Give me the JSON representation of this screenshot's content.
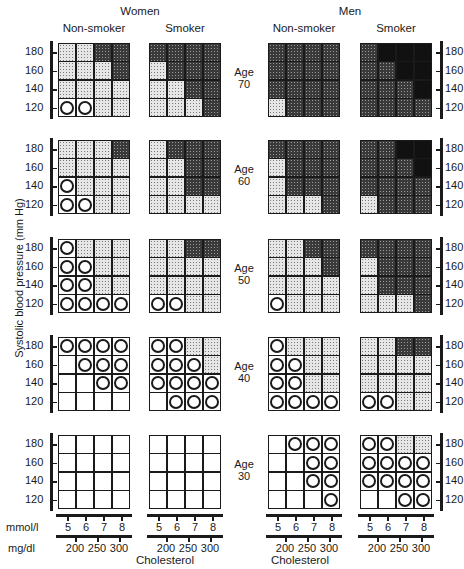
{
  "chart_data": {
    "type": "heatmap",
    "title": "",
    "group_headers": [
      "Women",
      "Men"
    ],
    "panel_headers": [
      "Non-smoker",
      "Smoker",
      "Non-smoker",
      "Smoker"
    ],
    "ylabel": "Systolic blood pressure (mm Hg)",
    "xlabel": "Cholesterol",
    "y_ticks": [
      "180",
      "160",
      "140",
      "120"
    ],
    "x_ticks_mmol": [
      "5",
      "6",
      "7",
      "8"
    ],
    "x_ticks_mgdl": [
      "200",
      "250",
      "300"
    ],
    "x_unit_mmol": "mmol/l",
    "x_unit_mgdl": "mg/dl",
    "legend_encoding": {
      "0": "white (no fill)",
      "C": "circle (lowest risk)",
      "L": "light stipple",
      "D": "dark stipple",
      "B": "solid black (highest risk)"
    },
    "rows": [
      {
        "age_label": "Age",
        "age_value": "70",
        "panels": [
          {
            "sex": "Women",
            "smoking": "Non-smoker",
            "cells": [
              [
                "L",
                "L",
                "D",
                "D"
              ],
              [
                "L",
                "L",
                "L",
                "D"
              ],
              [
                "L",
                "L",
                "L",
                "L"
              ],
              [
                "C",
                "C",
                "L",
                "L"
              ]
            ]
          },
          {
            "sex": "Women",
            "smoking": "Smoker",
            "cells": [
              [
                "D",
                "D",
                "D",
                "D"
              ],
              [
                "L",
                "D",
                "D",
                "D"
              ],
              [
                "L",
                "L",
                "D",
                "D"
              ],
              [
                "L",
                "L",
                "L",
                "D"
              ]
            ]
          },
          {
            "sex": "Men",
            "smoking": "Non-smoker",
            "cells": [
              [
                "D",
                "D",
                "D",
                "D"
              ],
              [
                "D",
                "D",
                "D",
                "D"
              ],
              [
                "D",
                "D",
                "D",
                "D"
              ],
              [
                "L",
                "D",
                "D",
                "D"
              ]
            ]
          },
          {
            "sex": "Men",
            "smoking": "Smoker",
            "cells": [
              [
                "D",
                "B",
                "B",
                "B"
              ],
              [
                "D",
                "D",
                "B",
                "B"
              ],
              [
                "D",
                "D",
                "D",
                "B"
              ],
              [
                "D",
                "D",
                "D",
                "D"
              ]
            ]
          }
        ]
      },
      {
        "age_label": "Age",
        "age_value": "60",
        "panels": [
          {
            "sex": "Women",
            "smoking": "Non-smoker",
            "cells": [
              [
                "L",
                "L",
                "L",
                "D"
              ],
              [
                "L",
                "L",
                "L",
                "L"
              ],
              [
                "C",
                "L",
                "L",
                "L"
              ],
              [
                "C",
                "C",
                "L",
                "L"
              ]
            ]
          },
          {
            "sex": "Women",
            "smoking": "Smoker",
            "cells": [
              [
                "L",
                "D",
                "D",
                "D"
              ],
              [
                "L",
                "L",
                "D",
                "D"
              ],
              [
                "L",
                "L",
                "D",
                "D"
              ],
              [
                "L",
                "L",
                "L",
                "L"
              ]
            ]
          },
          {
            "sex": "Men",
            "smoking": "Non-smoker",
            "cells": [
              [
                "D",
                "D",
                "D",
                "D"
              ],
              [
                "L",
                "D",
                "D",
                "D"
              ],
              [
                "L",
                "D",
                "D",
                "D"
              ],
              [
                "L",
                "L",
                "L",
                "D"
              ]
            ]
          },
          {
            "sex": "Men",
            "smoking": "Smoker",
            "cells": [
              [
                "D",
                "D",
                "B",
                "B"
              ],
              [
                "D",
                "D",
                "D",
                "B"
              ],
              [
                "D",
                "D",
                "D",
                "D"
              ],
              [
                "L",
                "D",
                "D",
                "D"
              ]
            ]
          }
        ]
      },
      {
        "age_label": "Age",
        "age_value": "50",
        "panels": [
          {
            "sex": "Women",
            "smoking": "Non-smoker",
            "cells": [
              [
                "C",
                "L",
                "L",
                "L"
              ],
              [
                "C",
                "C",
                "L",
                "L"
              ],
              [
                "C",
                "C",
                "L",
                "L"
              ],
              [
                "C",
                "C",
                "C",
                "C"
              ]
            ]
          },
          {
            "sex": "Women",
            "smoking": "Smoker",
            "cells": [
              [
                "L",
                "L",
                "D",
                "D"
              ],
              [
                "L",
                "L",
                "L",
                "L"
              ],
              [
                "L",
                "L",
                "L",
                "L"
              ],
              [
                "C",
                "C",
                "L",
                "L"
              ]
            ]
          },
          {
            "sex": "Men",
            "smoking": "Non-smoker",
            "cells": [
              [
                "L",
                "L",
                "D",
                "D"
              ],
              [
                "L",
                "L",
                "L",
                "D"
              ],
              [
                "L",
                "L",
                "L",
                "L"
              ],
              [
                "C",
                "L",
                "L",
                "L"
              ]
            ]
          },
          {
            "sex": "Men",
            "smoking": "Smoker",
            "cells": [
              [
                "D",
                "D",
                "D",
                "D"
              ],
              [
                "L",
                "D",
                "D",
                "D"
              ],
              [
                "L",
                "D",
                "D",
                "D"
              ],
              [
                "L",
                "L",
                "L",
                "D"
              ]
            ]
          }
        ]
      },
      {
        "age_label": "Age",
        "age_value": "40",
        "panels": [
          {
            "sex": "Women",
            "smoking": "Non-smoker",
            "cells": [
              [
                "C",
                "C",
                "C",
                "C"
              ],
              [
                "0",
                "C",
                "C",
                "C"
              ],
              [
                "0",
                "0",
                "C",
                "C"
              ],
              [
                "0",
                "0",
                "0",
                "0"
              ]
            ]
          },
          {
            "sex": "Women",
            "smoking": "Smoker",
            "cells": [
              [
                "C",
                "C",
                "L",
                "L"
              ],
              [
                "C",
                "C",
                "C",
                "L"
              ],
              [
                "C",
                "C",
                "C",
                "C"
              ],
              [
                "0",
                "C",
                "C",
                "C"
              ]
            ]
          },
          {
            "sex": "Men",
            "smoking": "Non-smoker",
            "cells": [
              [
                "C",
                "L",
                "L",
                "L"
              ],
              [
                "C",
                "C",
                "L",
                "L"
              ],
              [
                "C",
                "C",
                "L",
                "L"
              ],
              [
                "C",
                "C",
                "C",
                "C"
              ]
            ]
          },
          {
            "sex": "Men",
            "smoking": "Smoker",
            "cells": [
              [
                "L",
                "L",
                "D",
                "D"
              ],
              [
                "L",
                "L",
                "L",
                "L"
              ],
              [
                "L",
                "L",
                "L",
                "L"
              ],
              [
                "C",
                "C",
                "L",
                "L"
              ]
            ]
          }
        ]
      },
      {
        "age_label": "Age",
        "age_value": "30",
        "panels": [
          {
            "sex": "Women",
            "smoking": "Non-smoker",
            "cells": [
              [
                "0",
                "0",
                "0",
                "0"
              ],
              [
                "0",
                "0",
                "0",
                "0"
              ],
              [
                "0",
                "0",
                "0",
                "0"
              ],
              [
                "0",
                "0",
                "0",
                "0"
              ]
            ]
          },
          {
            "sex": "Women",
            "smoking": "Smoker",
            "cells": [
              [
                "0",
                "0",
                "0",
                "0"
              ],
              [
                "0",
                "0",
                "0",
                "0"
              ],
              [
                "0",
                "0",
                "0",
                "0"
              ],
              [
                "0",
                "0",
                "0",
                "0"
              ]
            ]
          },
          {
            "sex": "Men",
            "smoking": "Non-smoker",
            "cells": [
              [
                "0",
                "C",
                "C",
                "C"
              ],
              [
                "0",
                "0",
                "C",
                "C"
              ],
              [
                "0",
                "0",
                "C",
                "C"
              ],
              [
                "0",
                "0",
                "0",
                "C"
              ]
            ]
          },
          {
            "sex": "Men",
            "smoking": "Smoker",
            "cells": [
              [
                "C",
                "C",
                "L",
                "L"
              ],
              [
                "C",
                "C",
                "C",
                "C"
              ],
              [
                "C",
                "C",
                "C",
                "C"
              ],
              [
                "0",
                "0",
                "C",
                "C"
              ]
            ]
          }
        ]
      }
    ]
  },
  "labels": {
    "women": "Women",
    "men": "Men",
    "non_smoker": "Non-smoker",
    "smoker": "Smoker",
    "ylabel": "Systolic blood pressure (mm Hg)",
    "xlabel": "Cholesterol",
    "mmol": "mmol/l",
    "mgdl": "mg/dl"
  }
}
